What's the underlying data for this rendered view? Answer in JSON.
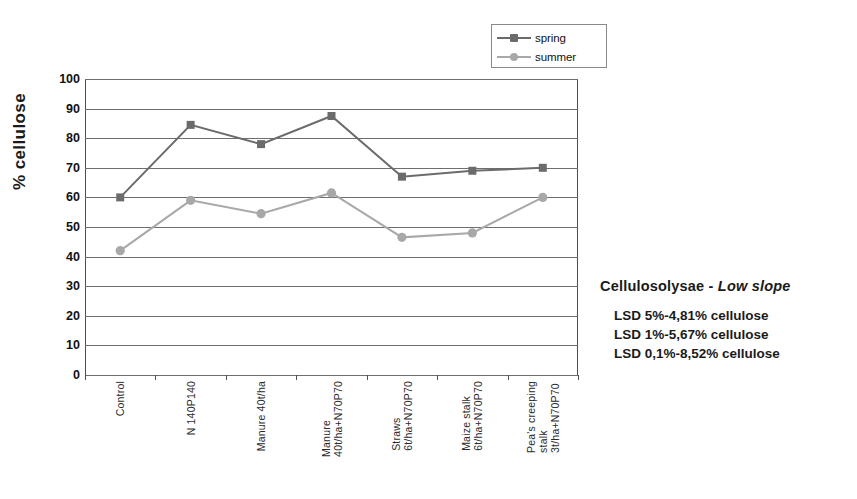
{
  "chart_data": {
    "type": "line",
    "title": "",
    "xlabel": "",
    "ylabel": "% cellulose",
    "ylim": [
      0,
      100
    ],
    "ytick_step": 10,
    "yticks": [
      100,
      90,
      80,
      70,
      60,
      50,
      40,
      30,
      20,
      10,
      0
    ],
    "grid": true,
    "legend_position": "top-right",
    "categories": [
      "Control",
      "N 140P140",
      "Manure 40t/ha",
      "Manure 40t/ha+N70P70",
      "Straws 6t/ha+N70P70",
      "Maize stalk 6t/ha+N70P70",
      "Pea's creeping stalk 3t/ha+N70P70"
    ],
    "category_lines": [
      [
        "Control"
      ],
      [
        "N 140P140"
      ],
      [
        "Manure 40t/ha"
      ],
      [
        "Manure",
        "40t/ha+N70P70"
      ],
      [
        "Straws",
        "6t/ha+N70P70"
      ],
      [
        "Maize stalk",
        "6t/ha+N70P70"
      ],
      [
        "Pea's creeping",
        "stalk",
        "3t/ha+N70P70"
      ]
    ],
    "series": [
      {
        "name": "spring",
        "color": "#6b6b6b",
        "marker": "square",
        "values": [
          60,
          84.5,
          78,
          87.5,
          67,
          69,
          70
        ]
      },
      {
        "name": "summer",
        "color": "#a8a8a8",
        "marker": "diamond",
        "values": [
          42,
          59,
          54.5,
          61.5,
          46.5,
          48,
          60
        ]
      }
    ]
  },
  "legend": {
    "entries": [
      {
        "label": "spring"
      },
      {
        "label": "summer"
      }
    ]
  },
  "annotation": {
    "title_main": "Cellulosolysae - ",
    "title_em": "Low slope",
    "lines": [
      "LSD 5%-4,81% cellulose",
      "LSD 1%-5,67% cellulose",
      "LSD 0,1%-8,52% cellulose"
    ]
  },
  "colors": {
    "spring": "#6b6b6b",
    "summer": "#a8a8a8",
    "grid": "#6e6e6e",
    "axis": "#4d4d4d"
  }
}
